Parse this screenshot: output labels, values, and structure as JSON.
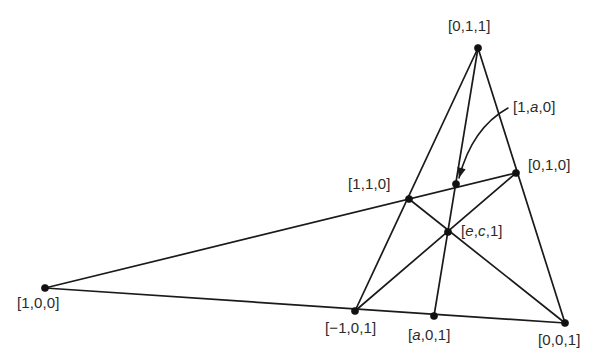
{
  "figure": {
    "kind": "projective-configuration-diagram",
    "background_color": "#ffffff",
    "line_color": "#1a1a1a",
    "label_color": "#2b2b2b",
    "width": 600,
    "height": 363
  },
  "labels": {
    "p_011": "[0,1,1]",
    "p_1a0": "[1,a,0]",
    "p_010": "[0,1,0]",
    "p_110": "[1,1,0]",
    "p_ec1": "[e,c,1]",
    "p_100": "[1,0,0]",
    "p_m101": "[−1,0,1]",
    "p_a01": "[a,0,1]",
    "p_001": "[0,0,1]"
  },
  "chart_data": {
    "type": "scatter",
    "title": "",
    "xlabel": "",
    "ylabel": "",
    "grid": false,
    "legend": "none",
    "points": [
      {
        "name": "p_011",
        "label": "[0,1,1]",
        "x": 478,
        "y": 48,
        "label_x": 448,
        "label_y": 18,
        "dot": true
      },
      {
        "name": "p_1a0",
        "label": "[1,a,0]",
        "x": 456,
        "y": 184,
        "label_x": 513,
        "label_y": 99,
        "dot": true
      },
      {
        "name": "p_010",
        "label": "[0,1,0]",
        "x": 516,
        "y": 173,
        "label_x": 528,
        "label_y": 157,
        "dot": true
      },
      {
        "name": "p_110",
        "label": "[1,1,0]",
        "x": 409,
        "y": 199,
        "label_x": 348,
        "label_y": 176,
        "dot": true
      },
      {
        "name": "p_ec1",
        "label": "[e,c,1]",
        "x": 448,
        "y": 232,
        "label_x": 461,
        "label_y": 223,
        "dot": true
      },
      {
        "name": "p_100",
        "label": "[1,0,0]",
        "x": 45,
        "y": 288,
        "label_x": 17,
        "label_y": 295,
        "dot": true
      },
      {
        "name": "p_m101",
        "label": "[−1,0,1]",
        "x": 355,
        "y": 311,
        "label_x": 325,
        "label_y": 320,
        "dot": true
      },
      {
        "name": "p_a01",
        "label": "[a,0,1]",
        "x": 434,
        "y": 316,
        "label_x": 408,
        "label_y": 327,
        "dot": true
      },
      {
        "name": "p_001",
        "label": "[0,0,1]",
        "x": 565,
        "y": 323,
        "label_x": 538,
        "label_y": 332,
        "dot": true
      }
    ],
    "segments": [
      {
        "name": "line-011-to-m101",
        "from": "p_011",
        "to": "p_m101"
      },
      {
        "name": "line-011-to-a01",
        "from": "p_011",
        "to": "p_a01"
      },
      {
        "name": "line-011-to-001",
        "from": "p_011",
        "to": "p_001"
      },
      {
        "name": "line-100-to-010",
        "from": "p_100",
        "to": "p_010"
      },
      {
        "name": "line-100-to-001",
        "from": "p_100",
        "to": "p_001"
      },
      {
        "name": "line-110-to-001",
        "from": "p_110",
        "to": "p_001"
      },
      {
        "name": "line-010-to-m101",
        "from": "p_010",
        "to": "p_m101"
      }
    ],
    "leader": {
      "name": "leader-arrow-1a0",
      "start_x": 508,
      "start_y": 108,
      "ctrl_x": 472,
      "ctrl_y": 128,
      "end_x": 459,
      "end_y": 178
    }
  }
}
